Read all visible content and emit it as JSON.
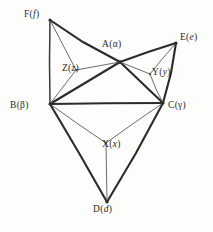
{
  "figure": {
    "kind": "hand-drawn-graph-diagram",
    "width": 213,
    "height": 232,
    "background_color": "#fdfdfc",
    "ink_color": "#2b2b2b",
    "thin_ink_color": "#5a5a58"
  },
  "labels": {
    "F": {
      "letter": "F",
      "paren_open": "(",
      "symbol": "f",
      "paren_close": ")",
      "full": "F(f)"
    },
    "E": {
      "letter": "E",
      "paren_open": "(",
      "symbol": "e",
      "paren_close": ")",
      "full": "E(e)"
    },
    "A": {
      "letter": "A",
      "paren_open": "(",
      "symbol": "α",
      "paren_close": ")",
      "full": "A(α)"
    },
    "Z": {
      "letter": "Z",
      "paren_open": "(",
      "symbol": "z",
      "paren_close": ")",
      "full": "Z(z)"
    },
    "Y": {
      "letter": "Y",
      "paren_open": "(",
      "symbol": "y",
      "paren_close": ")",
      "full": "Y(y)"
    },
    "B": {
      "letter": "B",
      "paren_open": "(",
      "symbol": "β",
      "paren_close": ")",
      "full": "B(β)"
    },
    "C": {
      "letter": "C",
      "paren_open": "(",
      "symbol": "γ",
      "paren_close": ")",
      "full": "C(γ)"
    },
    "X": {
      "letter": "X",
      "paren_open": "(",
      "symbol": "x",
      "paren_close": ")",
      "full": "X(x)"
    },
    "D": {
      "letter": "D",
      "paren_open": "(",
      "symbol": "d",
      "paren_close": ")",
      "full": "D(d)"
    }
  },
  "nodes": [
    {
      "id": "F",
      "x": 50,
      "y": 20,
      "kind": "outer"
    },
    {
      "id": "E",
      "x": 176,
      "y": 43,
      "kind": "outer"
    },
    {
      "id": "A",
      "x": 120,
      "y": 62,
      "kind": "hub"
    },
    {
      "id": "Z",
      "x": 76,
      "y": 70,
      "kind": "inner"
    },
    {
      "id": "Y",
      "x": 150,
      "y": 74,
      "kind": "inner"
    },
    {
      "id": "B",
      "x": 50,
      "y": 104,
      "kind": "outer"
    },
    {
      "id": "C",
      "x": 163,
      "y": 103,
      "kind": "outer"
    },
    {
      "id": "X",
      "x": 106,
      "y": 143,
      "kind": "inner"
    },
    {
      "id": "D",
      "x": 107,
      "y": 202,
      "kind": "outer"
    }
  ],
  "edges": [
    {
      "from": "F",
      "to": "A",
      "weight": "thick"
    },
    {
      "from": "F",
      "to": "B",
      "weight": "med"
    },
    {
      "from": "B",
      "to": "A",
      "weight": "thick"
    },
    {
      "from": "A",
      "to": "E",
      "weight": "thick"
    },
    {
      "from": "E",
      "to": "C",
      "weight": "thick"
    },
    {
      "from": "A",
      "to": "C",
      "weight": "thick"
    },
    {
      "from": "B",
      "to": "C",
      "weight": "thick"
    },
    {
      "from": "B",
      "to": "D",
      "weight": "thick"
    },
    {
      "from": "C",
      "to": "D",
      "weight": "thick"
    },
    {
      "from": "F",
      "to": "Z",
      "weight": "thin"
    },
    {
      "from": "B",
      "to": "Z",
      "weight": "thin"
    },
    {
      "from": "A",
      "to": "Z",
      "weight": "thin"
    },
    {
      "from": "A",
      "to": "Y",
      "weight": "thin"
    },
    {
      "from": "E",
      "to": "Y",
      "weight": "thin"
    },
    {
      "from": "C",
      "to": "Y",
      "weight": "thin"
    },
    {
      "from": "B",
      "to": "X",
      "weight": "thin"
    },
    {
      "from": "C",
      "to": "X",
      "weight": "thin"
    },
    {
      "from": "D",
      "to": "X",
      "weight": "thin"
    }
  ]
}
